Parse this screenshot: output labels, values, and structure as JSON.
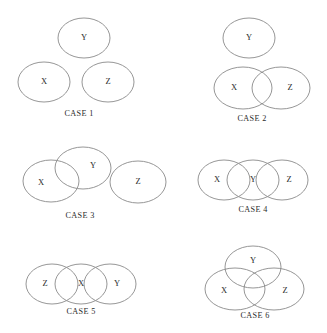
{
  "figure": {
    "type": "venn-diagram-set",
    "background_color": "#ffffff",
    "stroke_color": "#8a8a8a",
    "text_color": "#2b2b2b",
    "set_names": [
      "X",
      "Y",
      "Z"
    ],
    "cases": [
      {
        "id": "case-1",
        "caption": "CASE 1",
        "caption_x": 79,
        "caption_y": 114,
        "description": "All three sets disjoint",
        "shapes": [
          {
            "label": "Y",
            "cx": 84,
            "cy": 38,
            "rx": 26,
            "ry": 20,
            "label_x": 84,
            "label_y": 38
          },
          {
            "label": "X",
            "cx": 44,
            "cy": 82,
            "rx": 26,
            "ry": 20,
            "label_x": 44,
            "label_y": 82
          },
          {
            "label": "Z",
            "cx": 108,
            "cy": 82,
            "rx": 26,
            "ry": 20,
            "label_x": 108,
            "label_y": 82
          }
        ]
      },
      {
        "id": "case-2",
        "caption": "CASE 2",
        "caption_x": 252,
        "caption_y": 119,
        "description": "Y disjoint; X and Z overlap",
        "shapes": [
          {
            "label": "Y",
            "cx": 249,
            "cy": 38,
            "rx": 26,
            "ry": 20,
            "label_x": 249,
            "label_y": 38
          },
          {
            "label": "X",
            "cx": 243,
            "cy": 88,
            "rx": 29,
            "ry": 21,
            "label_x": 234,
            "label_y": 88
          },
          {
            "label": "Z",
            "cx": 281,
            "cy": 88,
            "rx": 29,
            "ry": 21,
            "label_x": 290,
            "label_y": 88
          }
        ]
      },
      {
        "id": "case-3",
        "caption": "CASE 3",
        "caption_x": 80,
        "caption_y": 216,
        "description": "X and Y overlap; Z disjoint",
        "shapes": [
          {
            "label": "X",
            "cx": 51,
            "cy": 181,
            "rx": 28,
            "ry": 21,
            "label_x": 41,
            "label_y": 183
          },
          {
            "label": "Y",
            "cx": 83,
            "cy": 168,
            "rx": 28,
            "ry": 21,
            "label_x": 93,
            "label_y": 166
          },
          {
            "label": "Z",
            "cx": 138,
            "cy": 182,
            "rx": 28,
            "ry": 21,
            "label_x": 138,
            "label_y": 182
          }
        ]
      },
      {
        "id": "case-4",
        "caption": "CASE 4",
        "caption_x": 253,
        "caption_y": 210,
        "description": "X overlaps Y, Y overlaps Z, X and Z disjoint",
        "shapes": [
          {
            "label": "X",
            "cx": 224,
            "cy": 180,
            "rx": 26,
            "ry": 20,
            "label_x": 217,
            "label_y": 180
          },
          {
            "label": "Y",
            "cx": 253,
            "cy": 180,
            "rx": 26,
            "ry": 20,
            "label_x": 253,
            "label_y": 180
          },
          {
            "label": "Z",
            "cx": 282,
            "cy": 180,
            "rx": 26,
            "ry": 20,
            "label_x": 289,
            "label_y": 180
          }
        ]
      },
      {
        "id": "case-5",
        "caption": "CASE 5",
        "caption_x": 81,
        "caption_y": 312,
        "description": "Z overlaps X, X overlaps Y, Z and Y disjoint",
        "shapes": [
          {
            "label": "Z",
            "cx": 52,
            "cy": 284,
            "rx": 26,
            "ry": 20,
            "label_x": 45,
            "label_y": 284
          },
          {
            "label": "X",
            "cx": 81,
            "cy": 284,
            "rx": 26,
            "ry": 20,
            "label_x": 81,
            "label_y": 284
          },
          {
            "label": "Y",
            "cx": 110,
            "cy": 284,
            "rx": 26,
            "ry": 20,
            "label_x": 117,
            "label_y": 284
          }
        ]
      },
      {
        "id": "case-6",
        "caption": "CASE 6",
        "caption_x": 255,
        "caption_y": 316,
        "description": "All three sets mutually overlap",
        "shapes": [
          {
            "label": "Y",
            "cx": 253,
            "cy": 267,
            "rx": 28,
            "ry": 21,
            "label_x": 253,
            "label_y": 261
          },
          {
            "label": "X",
            "cx": 235,
            "cy": 289,
            "rx": 30,
            "ry": 21,
            "label_x": 224,
            "label_y": 291
          },
          {
            "label": "Z",
            "cx": 274,
            "cy": 289,
            "rx": 30,
            "ry": 21,
            "label_x": 285,
            "label_y": 291
          }
        ]
      }
    ]
  }
}
